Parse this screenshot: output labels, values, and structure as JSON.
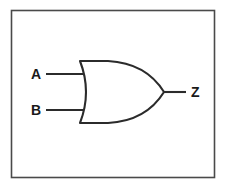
{
  "diagram": {
    "type": "logic-gate-schematic",
    "gate_kind": "OR",
    "frame": {
      "stroke_color": "#4a4a4a",
      "fill_color": "#ffffff",
      "x": 11,
      "y": 10,
      "width": 204,
      "height": 168
    },
    "line_color": "#2b2b2b",
    "background_color": "#ffffff",
    "inputs": [
      {
        "label": "A",
        "label_x": 35,
        "label_y": 79,
        "wire_y": 74,
        "wire_x1": 46,
        "wire_x2": 85
      },
      {
        "label": "B",
        "label_x": 35,
        "label_y": 115,
        "wire_y": 110,
        "wire_x1": 46,
        "wire_x2": 85
      }
    ],
    "outputs": [
      {
        "label": "Z",
        "label_x": 192,
        "label_y": 97,
        "wire_y": 92,
        "wire_x1": 163,
        "wire_x2": 186
      }
    ],
    "gate_geometry": {
      "back_x": 80,
      "back_bulge_x": 88,
      "top_y": 61,
      "bottom_y": 123,
      "tip_x": 164,
      "tip_y": 92,
      "nose_control_x": 150
    }
  }
}
